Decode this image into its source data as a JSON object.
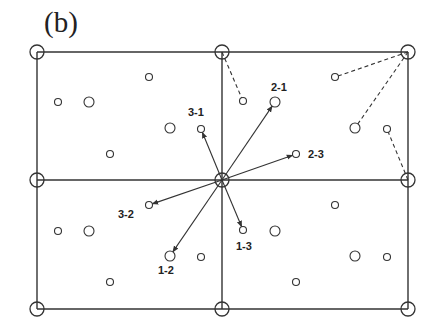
{
  "panel_label": "(b)",
  "colors": {
    "stroke": "#333333",
    "background": "#ffffff"
  },
  "grid": {
    "x": [
      37,
      222,
      408
    ],
    "y": [
      52,
      180,
      309
    ],
    "corner_radius": 7
  },
  "corner_nodes": [
    {
      "x": 37,
      "y": 52
    },
    {
      "x": 222,
      "y": 52
    },
    {
      "x": 408,
      "y": 52
    },
    {
      "x": 37,
      "y": 180
    },
    {
      "x": 222,
      "y": 180
    },
    {
      "x": 408,
      "y": 180
    },
    {
      "x": 37,
      "y": 309
    },
    {
      "x": 222,
      "y": 309
    },
    {
      "x": 408,
      "y": 309
    }
  ],
  "points": [
    {
      "x": 58,
      "y": 102,
      "r": 3.5
    },
    {
      "x": 89,
      "y": 102,
      "r": 5
    },
    {
      "x": 149,
      "y": 77,
      "r": 3.5
    },
    {
      "x": 170,
      "y": 128,
      "r": 5
    },
    {
      "x": 201,
      "y": 129,
      "r": 3.5,
      "label": "3-1"
    },
    {
      "x": 110,
      "y": 154,
      "r": 3.5
    },
    {
      "x": 243,
      "y": 101,
      "r": 3.5
    },
    {
      "x": 275,
      "y": 102,
      "r": 5,
      "label": "2-1"
    },
    {
      "x": 296,
      "y": 154,
      "r": 3.5,
      "label": "2-3"
    },
    {
      "x": 335,
      "y": 77,
      "r": 3.5
    },
    {
      "x": 355,
      "y": 128,
      "r": 5
    },
    {
      "x": 387,
      "y": 129,
      "r": 3.5
    },
    {
      "x": 58,
      "y": 231,
      "r": 3.5
    },
    {
      "x": 89,
      "y": 231,
      "r": 5
    },
    {
      "x": 149,
      "y": 205,
      "r": 3.5,
      "label": "3-2"
    },
    {
      "x": 170,
      "y": 256,
      "r": 5,
      "label": "1-2"
    },
    {
      "x": 201,
      "y": 257,
      "r": 3.5
    },
    {
      "x": 110,
      "y": 282,
      "r": 3.5
    },
    {
      "x": 243,
      "y": 230,
      "r": 3.5,
      "label": "1-3"
    },
    {
      "x": 275,
      "y": 231,
      "r": 5
    },
    {
      "x": 335,
      "y": 205,
      "r": 3.5
    },
    {
      "x": 355,
      "y": 256,
      "r": 5
    },
    {
      "x": 387,
      "y": 257,
      "r": 3.5
    },
    {
      "x": 296,
      "y": 282,
      "r": 3.5
    }
  ],
  "arrows": [
    {
      "from": [
        222,
        180
      ],
      "to": [
        201,
        129
      ],
      "label": "3-1"
    },
    {
      "from": [
        222,
        180
      ],
      "to": [
        275,
        102
      ],
      "label": "2-1"
    },
    {
      "from": [
        222,
        180
      ],
      "to": [
        296,
        154
      ],
      "label": "2-3"
    },
    {
      "from": [
        222,
        180
      ],
      "to": [
        149,
        205
      ],
      "label": "3-2"
    },
    {
      "from": [
        222,
        180
      ],
      "to": [
        170,
        256
      ],
      "label": "1-2"
    },
    {
      "from": [
        222,
        180
      ],
      "to": [
        243,
        230
      ],
      "label": "1-3"
    }
  ],
  "dashed_links": [
    {
      "from": [
        222,
        52
      ],
      "to": [
        243,
        101
      ]
    },
    {
      "from": [
        408,
        52
      ],
      "to": [
        335,
        77
      ]
    },
    {
      "from": [
        408,
        52
      ],
      "to": [
        355,
        128
      ]
    },
    {
      "from": [
        408,
        180
      ],
      "to": [
        387,
        129
      ]
    }
  ],
  "labels": [
    {
      "text": "3-1",
      "x": 188,
      "y": 116
    },
    {
      "text": "2-1",
      "x": 271,
      "y": 91
    },
    {
      "text": "2-3",
      "x": 308,
      "y": 158
    },
    {
      "text": "3-2",
      "x": 118,
      "y": 218
    },
    {
      "text": "1-2",
      "x": 158,
      "y": 274
    },
    {
      "text": "1-3",
      "x": 236,
      "y": 250
    }
  ]
}
